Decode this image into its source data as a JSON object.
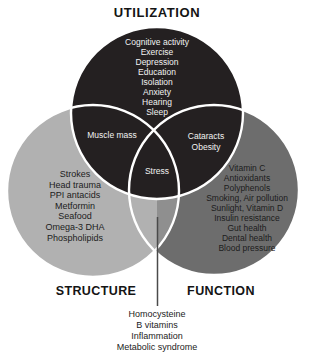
{
  "diagram": {
    "type": "venn-3",
    "circles": {
      "utilization": {
        "label": "UTILIZATION",
        "color": "#242021",
        "items": [
          "Cognitive activity",
          "Exercise",
          "Depression",
          "Education",
          "Isolation",
          "Anxiety",
          "Hearing",
          "Sleep"
        ]
      },
      "structure": {
        "label": "STRUCTURE",
        "color": "#b1b1b1",
        "items": [
          "Strokes",
          "Head trauma",
          "PPI antacids",
          "Metformin",
          "Seafood",
          "Omega-3 DHA",
          "Phospholipids"
        ]
      },
      "function": {
        "label": "FUNCTION",
        "color": "#6d6d6d",
        "items": [
          "Vitamin C",
          "Antioxidants",
          "Polyphenols",
          "Smoking, Air pollution",
          "Sunlight, Vitamin D",
          "Insulin resistance",
          "Gut health",
          "Dental health",
          "Blood pressure"
        ]
      }
    },
    "overlaps": {
      "utilization_structure": {
        "items": [
          "Muscle mass"
        ]
      },
      "utilization_function": {
        "items": [
          "Cataracts",
          "Obesity"
        ]
      },
      "all_three": {
        "items": [
          "Stress"
        ]
      },
      "structure_function": {
        "items": [
          "Homocysteine",
          "B vitamins",
          "Inflammation",
          "Metabolic syndrome"
        ]
      }
    },
    "colors": {
      "structure_function_shade": "#8f8f8f",
      "outline": "#ffffff",
      "connector_line": "#4a4a4a",
      "light_text": "#f2f2f2",
      "dark_text": "#1c1c1c"
    }
  }
}
